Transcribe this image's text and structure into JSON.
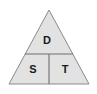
{
  "diagram": {
    "type": "triangle-three-region",
    "outline": {
      "apex_x": 49,
      "apex_y": 10,
      "base_left_x": 9,
      "base_right_x": 89,
      "base_y": 84
    },
    "dividers": {
      "horizontal_y": 54,
      "horizontal_left_x": 25,
      "horizontal_right_x": 73,
      "vertical_x": 49,
      "vertical_top_y": 54,
      "vertical_bottom_y": 84
    },
    "colors": {
      "fill": "#e2e2e2",
      "outline_stroke": "#8a8a8a",
      "divider_stroke": "#6e6e6e",
      "label_text": "#1a1a1a",
      "background": "#ffffff"
    },
    "regions": [
      {
        "id": "top",
        "label": "D",
        "label_x": 47,
        "label_y": 41
      },
      {
        "id": "bottom-left",
        "label": "S",
        "label_x": 33,
        "label_y": 70
      },
      {
        "id": "bottom-right",
        "label": "T",
        "label_x": 65,
        "label_y": 70
      }
    ]
  }
}
